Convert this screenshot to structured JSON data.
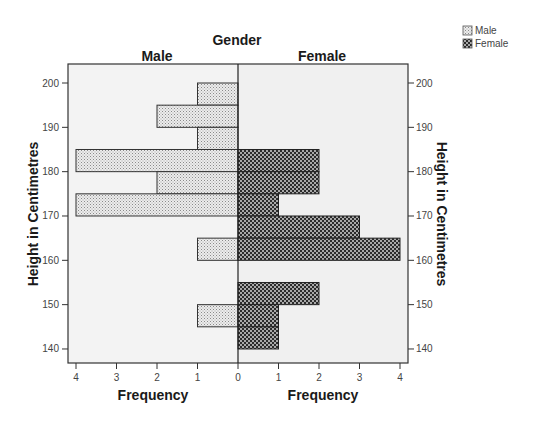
{
  "chart_data": {
    "type": "bar",
    "subtype": "population-pyramid-histogram",
    "title": "Gender",
    "panels": [
      "Male",
      "Female"
    ],
    "xlabel": "Frequency",
    "ylabel": "Height in Centimetres",
    "xlim": [
      0,
      4
    ],
    "x_ticks": [
      0,
      1,
      2,
      3,
      4
    ],
    "ylim": [
      136.8,
      204.3
    ],
    "y_ticks": [
      140,
      150,
      160,
      170,
      180,
      190,
      200
    ],
    "bin_width": 5,
    "bins": [
      {
        "range": [
          195,
          200
        ],
        "male": 1,
        "female": 0
      },
      {
        "range": [
          190,
          195
        ],
        "male": 2,
        "female": 0
      },
      {
        "range": [
          185,
          190
        ],
        "male": 1,
        "female": 0
      },
      {
        "range": [
          180,
          185
        ],
        "male": 4,
        "female": 2
      },
      {
        "range": [
          175,
          180
        ],
        "male": 2,
        "female": 2
      },
      {
        "range": [
          170,
          175
        ],
        "male": 4,
        "female": 1
      },
      {
        "range": [
          165,
          170
        ],
        "male": 0,
        "female": 3
      },
      {
        "range": [
          160,
          165
        ],
        "male": 1,
        "female": 4
      },
      {
        "range": [
          155,
          160
        ],
        "male": 0,
        "female": 0
      },
      {
        "range": [
          150,
          155
        ],
        "male": 0,
        "female": 2
      },
      {
        "range": [
          145,
          150
        ],
        "male": 1,
        "female": 1
      },
      {
        "range": [
          140,
          145
        ],
        "male": 0,
        "female": 1
      }
    ],
    "series": [
      {
        "name": "Male",
        "values": [
          1,
          2,
          1,
          4,
          2,
          4,
          0,
          1,
          0,
          0,
          1,
          0
        ],
        "pattern": "light-dotted",
        "color": "#d9d9d9"
      },
      {
        "name": "Female",
        "values": [
          0,
          0,
          0,
          2,
          2,
          1,
          3,
          4,
          0,
          2,
          1,
          1
        ],
        "pattern": "dark-checkered",
        "color": "#4a4a4a"
      }
    ],
    "categories": [
      "195-200",
      "190-195",
      "185-190",
      "180-185",
      "175-180",
      "170-175",
      "165-170",
      "160-165",
      "155-160",
      "150-155",
      "145-150",
      "140-145"
    ],
    "legend": {
      "position": "top-right",
      "entries": [
        "Male",
        "Female"
      ]
    },
    "grid": false
  },
  "labels": {
    "title": "Gender",
    "panel_left": "Male",
    "panel_right": "Female",
    "xlabel_left": "Frequency",
    "xlabel_right": "Frequency",
    "ylabel_left": "Height in Centimetres",
    "ylabel_right": "Height in Centimetres",
    "legend_male": "Male",
    "legend_female": "Female"
  },
  "colors": {
    "plot_bg_left": "#f3f3f3",
    "plot_bg_right": "#f1f1f1",
    "male_fill": "#dcdcdc",
    "female_fill": "#3c3c3c",
    "axis": "#333333"
  }
}
